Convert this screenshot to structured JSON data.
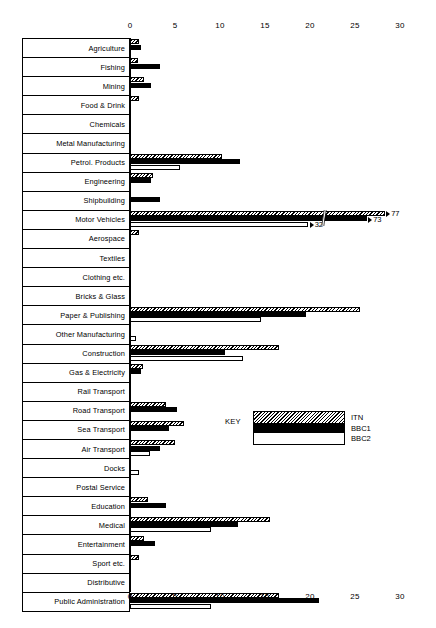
{
  "chart_data": {
    "type": "bar",
    "orientation": "horizontal",
    "title": "",
    "xlabel": "",
    "ylabel": "",
    "xlim": [
      0,
      30
    ],
    "ticks": [
      0,
      5,
      10,
      15,
      20,
      25,
      30
    ],
    "grid": false,
    "legend_title": "KEY",
    "legend_position": "middle-right",
    "categories": [
      "Agriculture",
      "Fishing",
      "Mining",
      "Food & Drink",
      "Chemicals",
      "Metal Manufacturing",
      "Petrol. Products",
      "Engineering",
      "Shipbuilding",
      "Motor Vehicles",
      "Aerospace",
      "Textiles",
      "Clothing etc.",
      "Bricks & Glass",
      "Paper & Publishing",
      "Other Manufacturing",
      "Construction",
      "Gas & Electricity",
      "Rail Transport",
      "Road Transport",
      "Sea Transport",
      "Air Transport",
      "Docks",
      "Postal Service",
      "Education",
      "Medical",
      "Entertainment",
      "Sport etc.",
      "Distributive",
      "Public Administration"
    ],
    "series": [
      {
        "name": "ITN",
        "fill": "hatched",
        "values": [
          1.0,
          0.9,
          1.6,
          1.0,
          0,
          0,
          10.2,
          2.5,
          0,
          77,
          1.0,
          0,
          0,
          0,
          25.5,
          0,
          16.5,
          1.4,
          0,
          4.0,
          6.0,
          5.0,
          0,
          0,
          2.0,
          15.5,
          1.5,
          1.0,
          0,
          16.5
        ]
      },
      {
        "name": "BBC1",
        "fill": "solid-black",
        "values": [
          1.2,
          3.3,
          2.3,
          0,
          0,
          0,
          12.2,
          2.3,
          3.3,
          73,
          0,
          0,
          0,
          0,
          19.5,
          0,
          10.5,
          1.2,
          0,
          5.2,
          4.3,
          3.3,
          0,
          0,
          4.0,
          12.0,
          2.8,
          0,
          0,
          21.0
        ]
      },
      {
        "name": "BBC2",
        "fill": "white",
        "values": [
          0,
          0,
          0,
          0,
          0,
          0,
          5.5,
          0,
          0,
          32,
          0,
          0,
          0,
          0,
          14.5,
          0.7,
          12.5,
          0,
          0,
          0,
          0,
          2.2,
          1.0,
          0,
          0,
          9.0,
          0,
          0,
          0,
          9.0
        ]
      }
    ],
    "annotations": [
      {
        "category": "Motor Vehicles",
        "series": "ITN",
        "label": "77",
        "broken_axis": true
      },
      {
        "category": "Motor Vehicles",
        "series": "BBC1",
        "label": "73",
        "broken_axis": true
      },
      {
        "category": "Motor Vehicles",
        "series": "BBC2",
        "label": "32",
        "broken_axis": true
      }
    ]
  },
  "legend": {
    "title": "KEY",
    "entries": [
      {
        "label": "ITN"
      },
      {
        "label": "BBC1"
      },
      {
        "label": "BBC2"
      }
    ]
  },
  "colors": {
    "ink": "#000000",
    "background": "#ffffff"
  }
}
